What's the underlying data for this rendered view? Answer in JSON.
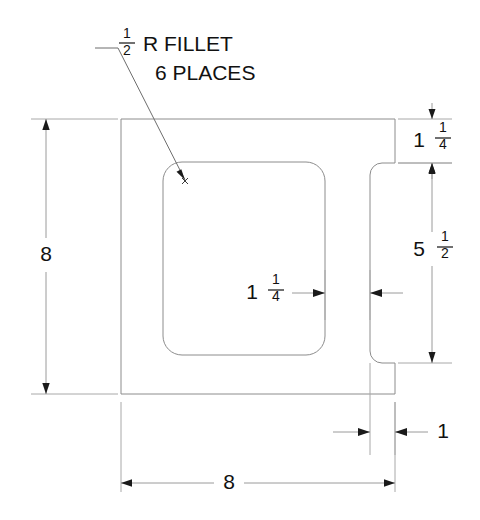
{
  "drawing": {
    "title_note": {
      "line1_whole": "",
      "line1_frac_num": "1",
      "line1_frac_den": "2",
      "line1_text": "R  FILLET",
      "line2_text": "6 PLACES"
    },
    "dimensions": {
      "left_height": {
        "label": "8",
        "value": 8
      },
      "bottom_width": {
        "label": "8",
        "value": 8
      },
      "right_top": {
        "whole": "1",
        "frac_num": "1",
        "frac_den": "4",
        "label": "1 1/4",
        "value": 1.25
      },
      "right_lower": {
        "whole": "5",
        "frac_num": "1",
        "frac_den": "2",
        "label": "5 1/2",
        "value": 5.5
      },
      "pocket_wall": {
        "whole": "1",
        "frac_num": "1",
        "frac_den": "4",
        "label": "1 1/4",
        "value": 1.25
      },
      "slot_width": {
        "label": "1",
        "value": 1
      }
    },
    "colors": {
      "object_line": "#8c8c8c",
      "dimension_line": "#9a9a9a",
      "text": "#111111",
      "background": "#ffffff"
    }
  }
}
